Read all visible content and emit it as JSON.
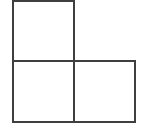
{
  "figure": {
    "name": "l-shaped-tromino",
    "canvas": {
      "width": 143,
      "height": 128
    },
    "background_color": "#ffffff",
    "fill_color": "#ffffff",
    "stroke_color": "#3f3f3f",
    "stroke_width": 2,
    "square_size": 61,
    "squares": [
      {
        "label": "top-left-square",
        "x": 13,
        "y": 1,
        "width": 61,
        "height": 60
      },
      {
        "label": "bottom-left-square",
        "x": 13,
        "y": 61,
        "width": 61,
        "height": 61
      },
      {
        "label": "bottom-right-square",
        "x": 74,
        "y": 61,
        "width": 61,
        "height": 61
      }
    ],
    "outline_points": "13,1 74,1 74,61 135,61 135,122 13,122",
    "interior_segments": [
      {
        "label": "horizontal-divider",
        "x1": 13,
        "y1": 61,
        "x2": 74,
        "y2": 61
      },
      {
        "label": "vertical-divider",
        "x1": 74,
        "y1": 61,
        "x2": 74,
        "y2": 122
      }
    ]
  }
}
